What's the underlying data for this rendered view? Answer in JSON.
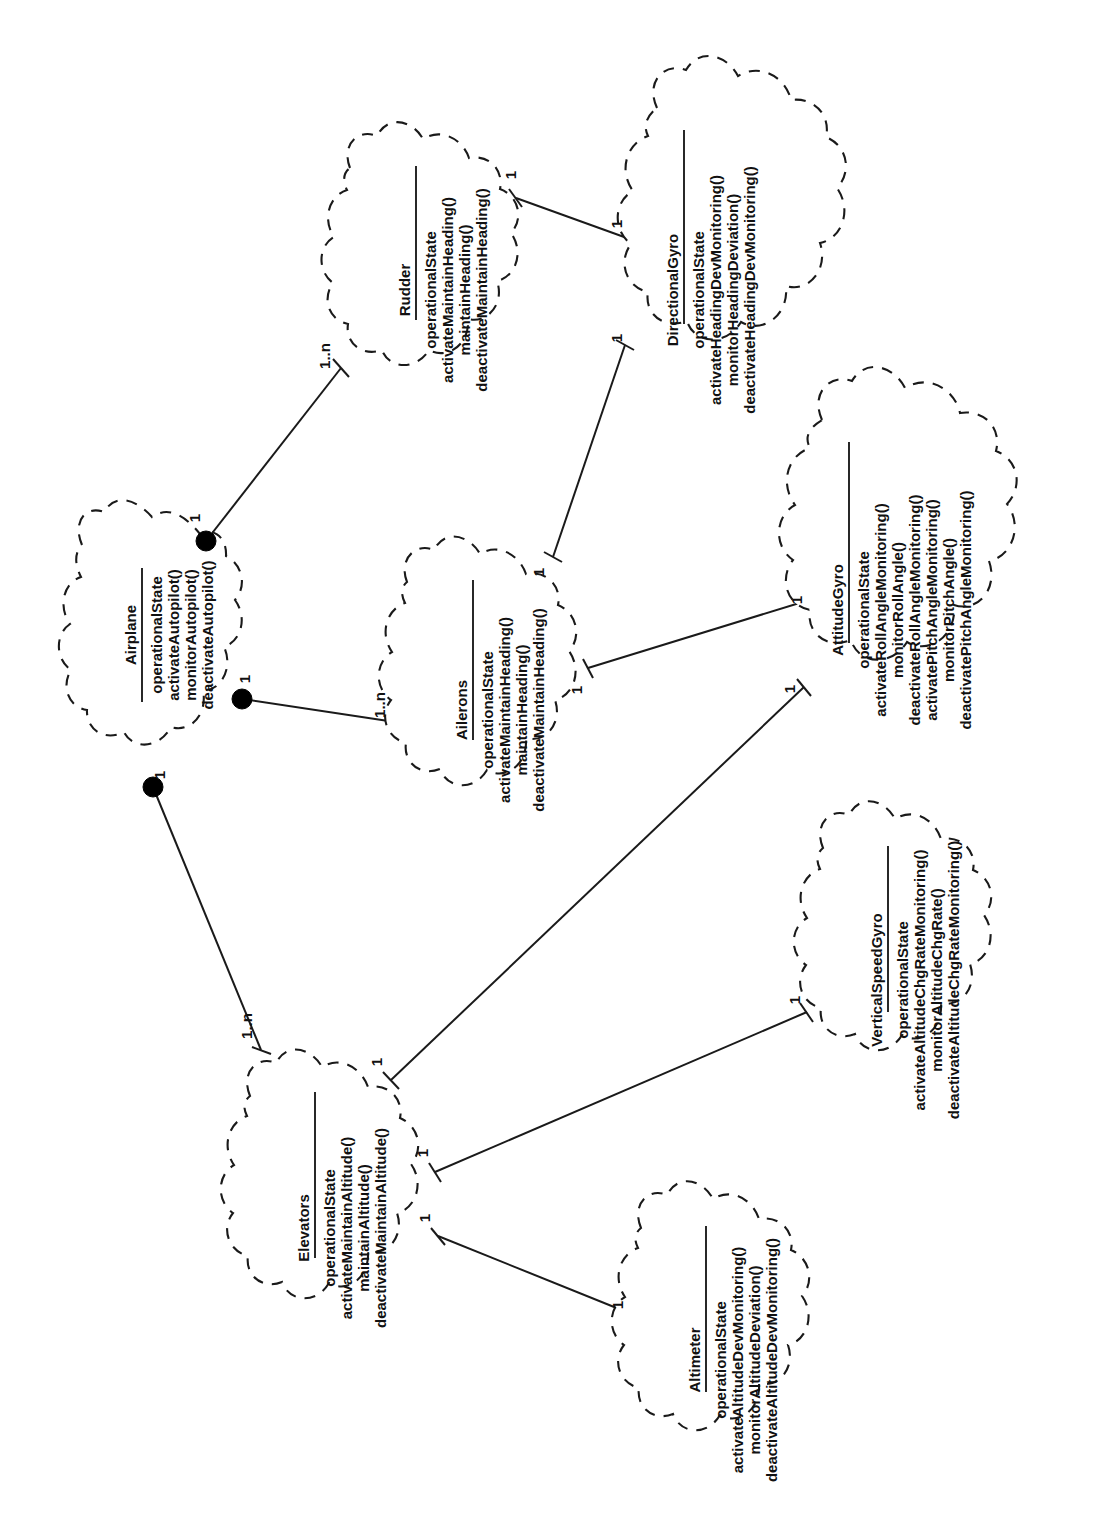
{
  "diagram": {
    "type": "uml-class-diagram",
    "orientation": "rotated-90-ccw",
    "stroke_color": "#1a1a1a",
    "background_color": "#ffffff"
  },
  "classes": [
    {
      "id": "airplane",
      "name": "Airplane",
      "members": [
        "operationalState",
        "activateAutopilot()",
        "monitorAutopilot()",
        "deactivateAutopilot()"
      ]
    },
    {
      "id": "rudder",
      "name": "Rudder",
      "members": [
        "operationalState",
        "activateMaintainHeading()",
        "maintainHeading()",
        "deactivateMaintainHeading()"
      ]
    },
    {
      "id": "ailerons",
      "name": "Ailerons",
      "members": [
        "operationalState",
        "activateMaintainHeading()",
        "maintainHeading()",
        "deactivateMaintainHeading()"
      ]
    },
    {
      "id": "elevators",
      "name": "Elevators",
      "members": [
        "operationalState",
        "activateMaintainAltitude()",
        "maintainAltitude()",
        "deactivateMaintainAltitude()"
      ]
    },
    {
      "id": "directionalgyro",
      "name": "DirectionalGyro",
      "members": [
        "operationalState",
        "activateHeadingDevMonitoring()",
        "monitorHeadingDeviation()",
        "deactivateHeadingDevMonitoring()"
      ]
    },
    {
      "id": "attitudegyro",
      "name": "AttitudeGyro",
      "members": [
        "operationalState",
        "activateRollAngleMonitoring()",
        "monitorRollAngle()",
        "deactivateRollAngleMonitoring()",
        "activatePitchAngleMonitoring()",
        "monitorPitchAngle()",
        "deactivatePitchAngleMonitoring()"
      ]
    },
    {
      "id": "verticalspeedgyro",
      "name": "VerticalSpeedGyro",
      "members": [
        "operationalState",
        "activateAltitudeChgRateMonitoring()",
        "monitorAltitudeChgRate()",
        "deactivateAltitudeChgRateMonitoring()"
      ]
    },
    {
      "id": "altimeter",
      "name": "Altimeter",
      "members": [
        "operationalState",
        "activateAltitudeDevMonitoring()",
        "monitorAltitudeDeviation()",
        "deactivateAltitudeDevMonitoring()"
      ]
    }
  ],
  "associations": [
    {
      "id": "airplane-rudder",
      "from": "airplane",
      "to": "rudder",
      "kind": "composition",
      "from_mult": "1",
      "to_mult": "1..n"
    },
    {
      "id": "airplane-ailerons",
      "from": "airplane",
      "to": "ailerons",
      "kind": "composition",
      "from_mult": "1",
      "to_mult": "1..n"
    },
    {
      "id": "airplane-elevators",
      "from": "airplane",
      "to": "elevators",
      "kind": "composition",
      "from_mult": "1",
      "to_mult": "1..n"
    },
    {
      "id": "rudder-directionalgyro",
      "from": "rudder",
      "to": "directionalgyro",
      "kind": "association",
      "from_mult": "1",
      "to_mult": "1"
    },
    {
      "id": "ailerons-directionalgyro",
      "from": "ailerons",
      "to": "directionalgyro",
      "kind": "association",
      "from_mult": "1",
      "to_mult": "1"
    },
    {
      "id": "ailerons-attitudegyro",
      "from": "ailerons",
      "to": "attitudegyro",
      "kind": "association",
      "from_mult": "1",
      "to_mult": "1"
    },
    {
      "id": "elevators-attitudegyro",
      "from": "elevators",
      "to": "attitudegyro",
      "kind": "association",
      "from_mult": "1",
      "to_mult": "1"
    },
    {
      "id": "elevators-vspeedgyro",
      "from": "elevators",
      "to": "verticalspeedgyro",
      "kind": "association",
      "from_mult": "1",
      "to_mult": "1"
    },
    {
      "id": "elevators-altimeter",
      "from": "elevators",
      "to": "altimeter",
      "kind": "association",
      "from_mult": "1",
      "to_mult": "1"
    }
  ]
}
